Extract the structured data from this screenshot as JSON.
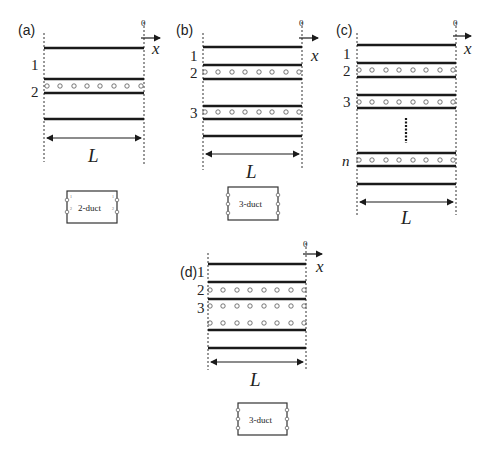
{
  "panels": {
    "a": {
      "label": "(a)",
      "duct_labels": [
        "1",
        "2"
      ],
      "length_label": "L",
      "axis_origin": "0",
      "axis_label": "x",
      "block": {
        "label": "2-duct",
        "ports_left": [
          "1",
          "2"
        ],
        "ports_right": [
          "1",
          "2"
        ]
      }
    },
    "b": {
      "label": "(b)",
      "duct_labels": [
        "1",
        "2",
        "3"
      ],
      "length_label": "L",
      "axis_origin": "0",
      "axis_label": "x",
      "block": {
        "label": "3-duct",
        "ports_left": [
          "1",
          "2",
          "3"
        ],
        "ports_right": [
          "1",
          "2",
          "3"
        ]
      }
    },
    "c": {
      "label": "(c)",
      "duct_labels": [
        "1",
        "2",
        "3",
        "n"
      ],
      "length_label": "L",
      "axis_origin": "0",
      "axis_label": "x"
    },
    "d": {
      "label": "(d)",
      "duct_labels": [
        "1",
        "2",
        "3"
      ],
      "length_label": "L",
      "axis_origin": "0",
      "axis_label": "x",
      "block": {
        "label": "3-duct",
        "ports_left": [
          "1",
          "2",
          "3"
        ],
        "ports_right": [
          "1",
          "2",
          "3"
        ]
      }
    }
  }
}
